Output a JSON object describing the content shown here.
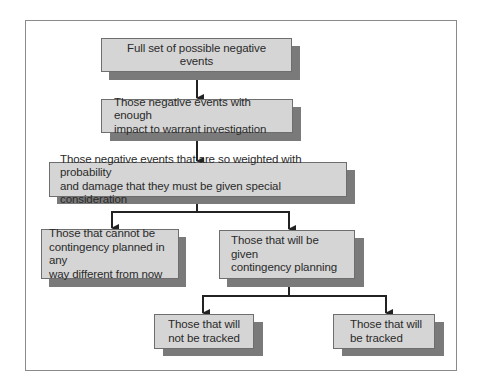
{
  "diagram": {
    "type": "flowchart",
    "colors": {
      "box_fill": "#d5d5d5",
      "box_border": "#6e6e6e",
      "shadow": "#7a7a7a",
      "connector": "#222222",
      "frame_border": "#8a8a8a"
    },
    "nodes": [
      {
        "id": "full-set",
        "label": "Full set of possible negative events"
      },
      {
        "id": "warrant-investigation",
        "label": "Those negative events with enough\nimpact to warrant  investigation"
      },
      {
        "id": "special-consideration",
        "label": "Those negative events that are so weighted with probability\nand damage that they must be given special consideration"
      },
      {
        "id": "cannot-be-planned",
        "label": "Those that cannot be\ncontingency planned in any\nway different from now"
      },
      {
        "id": "contingency-planning",
        "label": "Those that will be given\ncontingency planning"
      },
      {
        "id": "not-tracked",
        "label": "Those that will\nnot be tracked"
      },
      {
        "id": "tracked",
        "label": "Those that will\nbe tracked"
      }
    ],
    "edges": [
      {
        "from": "full-set",
        "to": "warrant-investigation"
      },
      {
        "from": "warrant-investigation",
        "to": "special-consideration"
      },
      {
        "from": "special-consideration",
        "to": "cannot-be-planned"
      },
      {
        "from": "special-consideration",
        "to": "contingency-planning"
      },
      {
        "from": "contingency-planning",
        "to": "not-tracked"
      },
      {
        "from": "contingency-planning",
        "to": "tracked"
      }
    ]
  }
}
